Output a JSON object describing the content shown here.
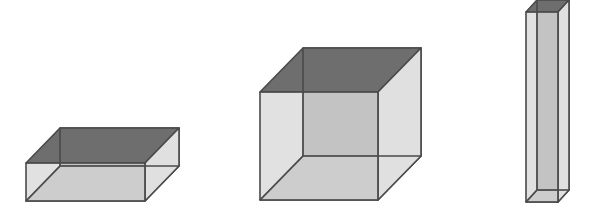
{
  "figure": {
    "colors": {
      "background": "#ffffff",
      "edge": "#4a4a4a",
      "top_face": "#6e6e6e",
      "front_face": "#c9c9c9",
      "side_face": "#e0e0e0",
      "bottom_face": "#d2d2d2",
      "back_face": "#bdbdbd"
    },
    "boxes": [
      {
        "name": "flat-box",
        "front": {
          "x": 26,
          "y": 163,
          "w": 119,
          "h": 38
        },
        "depth": {
          "dx": 34,
          "dy": -35
        }
      },
      {
        "name": "cube-box",
        "front": {
          "x": 260,
          "y": 92,
          "w": 118,
          "h": 108
        },
        "depth": {
          "dx": 43,
          "dy": -44
        }
      },
      {
        "name": "tall-box",
        "front": {
          "x": 526,
          "y": 12,
          "w": 32,
          "h": 190
        },
        "depth": {
          "dx": 11,
          "dy": -12
        }
      }
    ]
  }
}
